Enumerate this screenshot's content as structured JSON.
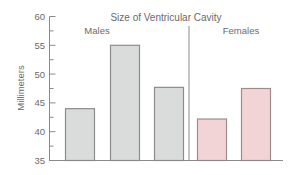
{
  "chart_data": {
    "type": "bar",
    "title": "Size of Ventricular Cavity",
    "xlabel": "",
    "ylabel": "Millimeters",
    "ylim": [
      35,
      60
    ],
    "yticks": [
      35,
      40,
      45,
      50,
      55,
      60
    ],
    "grid": false,
    "legend": null,
    "groups": [
      {
        "name": "Males",
        "color": "#dadcdc",
        "values": [
          44.0,
          55.0,
          47.7
        ]
      },
      {
        "name": "Females",
        "color": "#f2d4d7",
        "values": [
          42.2,
          47.5
        ]
      }
    ],
    "categories": [
      "",
      "",
      "",
      "",
      ""
    ],
    "values": [
      44.0,
      55.0,
      47.7,
      42.2,
      47.5
    ]
  },
  "colors": {
    "male_fill": "#dadcdc",
    "male_border": "#8c8c8c",
    "female_fill": "#f2d4d7",
    "female_border": "#a08a8c",
    "axis": "#8a8a8a",
    "text": "#6a6a6a"
  }
}
